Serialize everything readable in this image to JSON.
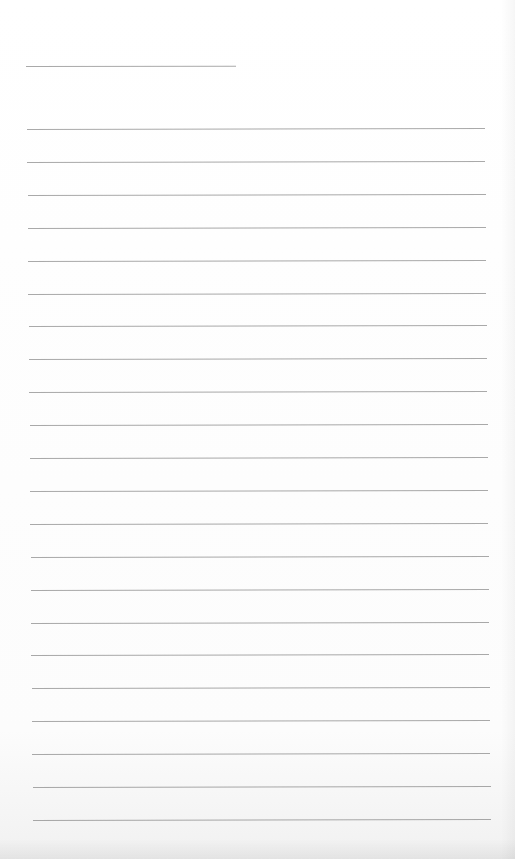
{
  "document": {
    "type": "lined-writing-sheet",
    "title_line": {
      "present": true,
      "text": ""
    },
    "ruled_lines": {
      "count": 22,
      "start_y": 129,
      "spacing": 32.9,
      "left": 27,
      "width": 458
    },
    "line_color": "#8c8c8c",
    "background": "#fefefe",
    "content": []
  }
}
